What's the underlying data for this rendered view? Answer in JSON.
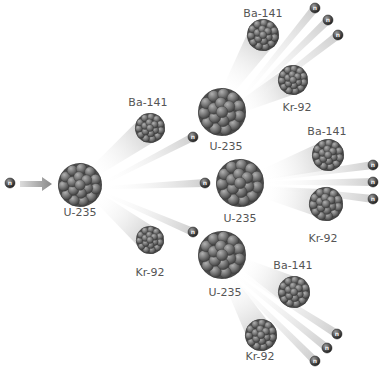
{
  "colors": {
    "nucleus": "#7a7a7a",
    "nucleus_dark": "#3e3e3e",
    "neutron": "#4a4a4a",
    "label": "#555555",
    "arrow": "#8a8a8a"
  },
  "neutron_symbol": "n",
  "incoming": {
    "neutron_label": "n"
  },
  "generation1": {
    "parent": "U-235",
    "ba": "Ba-141",
    "kr": "Kr-92"
  },
  "branches": [
    {
      "parent": "U-235",
      "ba": "Ba-141",
      "kr": "Kr-92",
      "neutrons": [
        "n",
        "n",
        "n"
      ]
    },
    {
      "parent": "U-235",
      "ba": "Ba-141",
      "kr": "Kr-92",
      "neutrons": [
        "n",
        "n",
        "n"
      ]
    },
    {
      "parent": "U-235",
      "ba": "Ba-141",
      "kr": "Kr-92",
      "neutrons": [
        "n",
        "n",
        "n"
      ]
    }
  ]
}
